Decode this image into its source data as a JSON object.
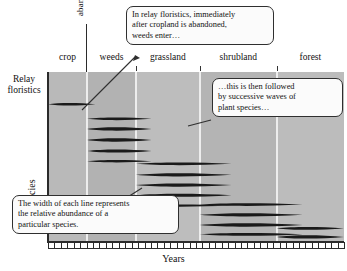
{
  "figure": {
    "title_label": "Relay\nfloristics",
    "relay_line1": "Relay",
    "relay_line2": "floristics",
    "y_axis_label": "Species",
    "x_axis_label": "Years",
    "abandonment_label": "abandonment"
  },
  "zones": [
    {
      "label": "crop",
      "x_pct": 0,
      "w_pct": 13.2
    },
    {
      "label": "weeds",
      "x_pct": 13.2,
      "w_pct": 16.5
    },
    {
      "label": "grassland",
      "x_pct": 29.7,
      "w_pct": 21.6
    },
    {
      "label": "shrubland",
      "x_pct": 51.3,
      "w_pct": 26.0
    },
    {
      "label": "forest",
      "x_pct": 77.3,
      "w_pct": 22.7
    }
  ],
  "callouts": [
    {
      "id": "callout-weeds",
      "lines": [
        "In relay floristics, immediately",
        "after cropland is abandoned,",
        "weeds enter…"
      ]
    },
    {
      "id": "callout-waves",
      "lines": [
        "…this is then followed",
        "by successive waves of",
        "plant species…"
      ]
    },
    {
      "id": "callout-width",
      "lines": [
        "The width of each line represents",
        "the relative abundance of a",
        "particular species."
      ]
    }
  ],
  "colors": {
    "plot_background": "#b6b6b6",
    "zone_divider": "#ededed",
    "species_line": "#1a1a1a",
    "axis": "#2b2b2b",
    "callout_fill": "#fbfbfb",
    "callout_border": "#2f2f2f"
  },
  "chart_data": {
    "type": "area",
    "title": "Relay floristics",
    "xlabel": "Years",
    "ylabel": "Species",
    "xlim": [
      0,
      100
    ],
    "ylim": [
      0,
      100
    ],
    "grid": false,
    "legend": "none",
    "annotations": [
      "In relay floristics, immediately after cropland is abandoned, weeds enter…",
      "…this is then followed by successive waves of plant species…",
      "The width of each line represents the relative abundance of a particular species.",
      "abandonment"
    ],
    "categories": [
      "crop",
      "weeds",
      "grassland",
      "shrubland",
      "forest"
    ],
    "category_boundaries_pct": [
      0,
      13.2,
      29.7,
      51.3,
      77.3,
      100
    ],
    "series": [
      {
        "name": "crop species 1",
        "group": "crop",
        "start_pct": 0.0,
        "end_pct": 16.0,
        "y_pct": 19.0,
        "peak_width_px": 3.2
      },
      {
        "name": "weed species 1",
        "group": "weeds",
        "start_pct": 13.2,
        "end_pct": 35.0,
        "y_pct": 27.5,
        "peak_width_px": 3.6
      },
      {
        "name": "weed species 2",
        "group": "weeds",
        "start_pct": 13.2,
        "end_pct": 35.0,
        "y_pct": 33.5,
        "peak_width_px": 4.4
      },
      {
        "name": "weed species 3",
        "group": "weeds",
        "start_pct": 13.2,
        "end_pct": 35.0,
        "y_pct": 40.0,
        "peak_width_px": 4.6
      },
      {
        "name": "weed species 4",
        "group": "weeds",
        "start_pct": 13.2,
        "end_pct": 35.0,
        "y_pct": 46.5,
        "peak_width_px": 4.0
      },
      {
        "name": "weed species 5",
        "group": "weeds",
        "start_pct": 13.2,
        "end_pct": 35.0,
        "y_pct": 52.5,
        "peak_width_px": 3.2
      },
      {
        "name": "grassland species 1",
        "group": "grassland",
        "start_pct": 29.7,
        "end_pct": 62.0,
        "y_pct": 54.0,
        "peak_width_px": 3.6
      },
      {
        "name": "grassland species 2",
        "group": "grassland",
        "start_pct": 29.7,
        "end_pct": 62.0,
        "y_pct": 60.5,
        "peak_width_px": 4.4
      },
      {
        "name": "grassland species 3",
        "group": "grassland",
        "start_pct": 29.7,
        "end_pct": 62.0,
        "y_pct": 66.5,
        "peak_width_px": 4.6
      },
      {
        "name": "grassland species 4",
        "group": "grassland",
        "start_pct": 29.7,
        "end_pct": 62.0,
        "y_pct": 72.5,
        "peak_width_px": 4.0
      },
      {
        "name": "grassland species 5",
        "group": "grassland",
        "start_pct": 29.7,
        "end_pct": 62.0,
        "y_pct": 78.5,
        "peak_width_px": 3.0
      },
      {
        "name": "shrubland species 1",
        "group": "shrubland",
        "start_pct": 51.3,
        "end_pct": 86.0,
        "y_pct": 78.0,
        "peak_width_px": 3.6
      },
      {
        "name": "shrubland species 2",
        "group": "shrubland",
        "start_pct": 51.3,
        "end_pct": 86.0,
        "y_pct": 84.0,
        "peak_width_px": 4.4
      },
      {
        "name": "shrubland species 3",
        "group": "shrubland",
        "start_pct": 51.3,
        "end_pct": 86.0,
        "y_pct": 90.0,
        "peak_width_px": 4.6
      },
      {
        "name": "shrubland species 4",
        "group": "shrubland",
        "start_pct": 51.3,
        "end_pct": 86.0,
        "y_pct": 95.5,
        "peak_width_px": 3.8
      },
      {
        "name": "forest species 1",
        "group": "forest",
        "start_pct": 77.3,
        "end_pct": 100.0,
        "y_pct": 92.0,
        "peak_width_px": 3.6
      },
      {
        "name": "forest species 2",
        "group": "forest",
        "start_pct": 77.3,
        "end_pct": 100.0,
        "y_pct": 97.0,
        "peak_width_px": 4.4
      },
      {
        "name": "forest species 3",
        "group": "forest",
        "start_pct": 77.3,
        "end_pct": 100.0,
        "y_pct": 101.5,
        "peak_width_px": 4.0
      }
    ]
  }
}
